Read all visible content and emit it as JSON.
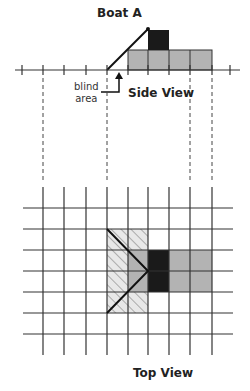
{
  "title": "Boat A",
  "side_view": {
    "label": "Side View",
    "blind_area_label_line1": "blind",
    "blind_area_label_line2": "area"
  },
  "top_view": {
    "label": "Top View"
  },
  "colors": {
    "grid": "#333333",
    "boat_gray": "#b3b3b3",
    "boat_dark": "#1a1a1a",
    "hatch": "#999999",
    "hatch_bg": "#e6e6e6"
  }
}
